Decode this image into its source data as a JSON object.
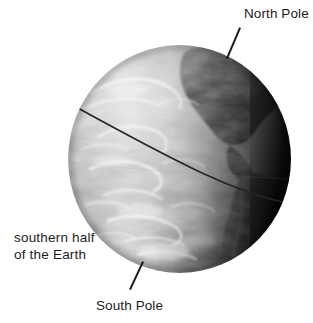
{
  "figure": {
    "background_color": "#ffffff",
    "width": 313,
    "height": 323
  },
  "globe": {
    "name": "earth-globe",
    "center_x": 179,
    "center_y": 159,
    "radius": 111,
    "terminator_note": "right limb shaded dark, left/upper-left brightly lit",
    "equator_line_color": "#2b2b2b",
    "ocean_light": "#b9b9b9",
    "land_dark": "#4a4a4a",
    "cloud_white": "#f1f1f1",
    "shadow_edge": "#0b0b0b"
  },
  "labels": {
    "north_pole": "North Pole",
    "south_pole": "South Pole",
    "southern_half_line1": "southern half",
    "southern_half_line2": "of the Earth",
    "text_color": "#1c1c1c"
  },
  "leaders": {
    "north_label": "leader line from North Pole label to top of globe",
    "south_label": "leader line from South Pole label to bottom of globe",
    "color": "#1a1a1a"
  }
}
